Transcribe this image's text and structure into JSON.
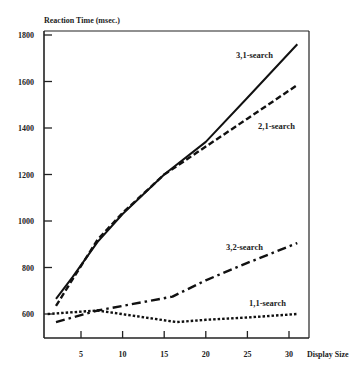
{
  "chart_data": {
    "type": "line",
    "title": "",
    "ylabel": "Reaction Time (msec.)",
    "xlabel": "Display Size",
    "xlim": [
      0,
      32
    ],
    "ylim": [
      500,
      1800
    ],
    "x_ticks": [
      5,
      10,
      15,
      20,
      25,
      30
    ],
    "y_ticks": [
      600,
      800,
      1000,
      1200,
      1400,
      1600,
      1800
    ],
    "grid": false,
    "legend": "inline labels near line ends",
    "series": [
      {
        "name": "3,1-search",
        "style": "solid",
        "x": [
          2,
          4,
          7,
          10,
          15,
          20,
          25,
          31
        ],
        "values": [
          665,
          760,
          910,
          1030,
          1200,
          1340,
          1530,
          1760
        ]
      },
      {
        "name": "2,1-search",
        "style": "dashed",
        "x": [
          2,
          4,
          7,
          10,
          15,
          20,
          25,
          31
        ],
        "values": [
          635,
          750,
          920,
          1035,
          1200,
          1320,
          1440,
          1585
        ]
      },
      {
        "name": "3,2-search",
        "style": "dash-dot",
        "x": [
          2,
          7,
          16,
          20,
          25,
          31
        ],
        "values": [
          565,
          615,
          675,
          745,
          820,
          905
        ]
      },
      {
        "name": "1,1-search",
        "style": "dotted",
        "x": [
          1,
          7,
          16.5,
          20,
          25,
          31
        ],
        "values": [
          600,
          615,
          565,
          575,
          585,
          600
        ]
      }
    ]
  },
  "labels": {
    "y_axis_title": "Reaction Time (msec.)",
    "x_axis_title": "Display Size",
    "y_ticks": [
      "1800",
      "1600",
      "1400",
      "1200",
      "1000",
      "800",
      "600"
    ],
    "x_ticks": [
      "5",
      "10",
      "15",
      "20",
      "25",
      "30"
    ],
    "series": [
      "3,1-search",
      "2,1-search",
      "3,2-search",
      "1,1-search"
    ]
  }
}
